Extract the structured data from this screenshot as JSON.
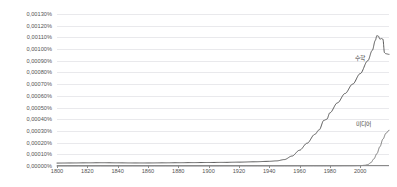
{
  "chart_data": {
    "type": "line",
    "title": "",
    "subtitle": "",
    "xlabel": "",
    "ylabel": "",
    "xlim": [
      1800,
      2019
    ],
    "ylim": [
      0.0,
      0.0013
    ],
    "grid": true,
    "legend_position": "inline-right-annotation",
    "y_tick_labels": [
      "0,00130%",
      "0,00120%",
      "0,00110%",
      "0,00100%",
      "0,00090%",
      "0,00080%",
      "0,00070%",
      "0,00060%",
      "0,00050%",
      "0,00040%",
      "0,00030%",
      "0,00020%",
      "0,00010%",
      "0,00000%"
    ],
    "y_tick_values": [
      0.0013,
      0.0012,
      0.0011,
      0.001,
      0.0009,
      0.0008,
      0.0007,
      0.0006,
      0.0005,
      0.0004,
      0.0003,
      0.0002,
      0.0001,
      0.0
    ],
    "x_tick_labels": [
      "1800",
      "1820",
      "1840",
      "1860",
      "1880",
      "1900",
      "1920",
      "1940",
      "1960",
      "1980",
      "2000"
    ],
    "x_tick_values": [
      1800,
      1820,
      1840,
      1860,
      1880,
      1900,
      1920,
      1940,
      1960,
      1980,
      2000
    ],
    "series": [
      {
        "name": "수학",
        "label": "수학",
        "color": "#4a4a4a",
        "x": [
          1800,
          1810,
          1820,
          1830,
          1840,
          1850,
          1860,
          1870,
          1880,
          1890,
          1900,
          1910,
          1920,
          1930,
          1940,
          1945,
          1950,
          1955,
          1960,
          1965,
          1970,
          1973,
          1976,
          1978,
          1980,
          1985,
          1990,
          1995,
          2000,
          2005,
          2008,
          2010,
          2011,
          2012,
          2013,
          2014,
          2015,
          2016,
          2017,
          2019
        ],
        "values": [
          2.5e-05,
          2.6e-05,
          2.7e-05,
          2.8e-05,
          2.7e-05,
          2.6e-05,
          2.6e-05,
          2.7e-05,
          2.8e-05,
          2.9e-05,
          3e-05,
          3.1e-05,
          3.3e-05,
          3.6e-05,
          4e-05,
          4.4e-05,
          5.5e-05,
          8.5e-05,
          0.000135,
          0.000195,
          0.00027,
          0.00031,
          0.00039,
          0.0004,
          0.000455,
          0.00054,
          0.00062,
          0.0007,
          0.00079,
          0.0009,
          0.00099,
          0.001075,
          0.001115,
          0.00111,
          0.001085,
          0.00109,
          0.001085,
          0.00097,
          0.00096,
          0.000955
        ]
      },
      {
        "name": "미디어",
        "label": "미디어",
        "color": "#6e6e6e",
        "x": [
          1800,
          1900,
          1950,
          1980,
          1995,
          2000,
          2003,
          2005,
          2007,
          2009,
          2011,
          2013,
          2015,
          2017,
          2019
        ],
        "values": [
          5e-07,
          8e-07,
          1e-06,
          1.5e-06,
          2e-06,
          3e-06,
          6e-06,
          1.2e-05,
          2.8e-05,
          6e-05,
          0.000105,
          0.000165,
          0.00023,
          0.00028,
          0.000305
        ]
      }
    ]
  },
  "annotations": {
    "math": "수학",
    "media": "미디어"
  },
  "colors": {
    "gridline": "#e9e9ec",
    "axis": "#8a8a8a",
    "tick_text": "#545454",
    "series_primary": "#4a4a4a",
    "series_secondary": "#6e6e6e",
    "background": "#ffffff"
  }
}
